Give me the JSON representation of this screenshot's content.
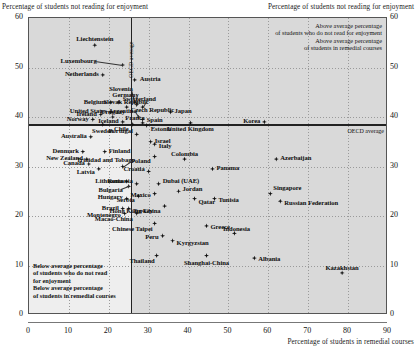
{
  "titles": {
    "y_left": "Percentage of students not reading for enjoyment",
    "y_right": "Percentage of students not reading for enjoyment",
    "x_bottom": "Percentage of students in remedial courses"
  },
  "annotations": {
    "top_right": "Above average percentage\nof students who do not read for enjoyment\nAbove average percentage\nof students in remedial courses",
    "bottom_left": "Below average percentage\nof students who do not read\nfor enjoyment\nBelow average percentage\nof students in remedial courses",
    "oecd_vertical": "OECD average",
    "oecd_horizontal": "OECD average"
  },
  "chart_data": {
    "type": "scatter",
    "title": "",
    "xlabel": "Percentage of students in remedial courses",
    "ylabel": "Percentage of students not reading for enjoyment",
    "xlim": [
      0,
      90
    ],
    "ylim": [
      0,
      60
    ],
    "xticks": [
      0,
      10,
      20,
      30,
      40,
      50,
      60,
      70,
      80,
      90
    ],
    "yticks": [
      0,
      10,
      20,
      30,
      40,
      50,
      60
    ],
    "grid": true,
    "legend": "none",
    "reference_lines": {
      "oecd_average_x": 25.5,
      "oecd_average_y": 37.8
    },
    "points": [
      {
        "name": "Liechtenstein",
        "x": 16.5,
        "y": 54.5
      },
      {
        "name": "Luxembourg",
        "x": 23.5,
        "y": 50.5
      },
      {
        "name": "Netherlands",
        "x": 18.5,
        "y": 48.5
      },
      {
        "name": "Austria",
        "x": 26.5,
        "y": 47.5
      },
      {
        "name": "Slovenia",
        "x": 26.5,
        "y": 43.0
      },
      {
        "name": "Germany",
        "x": 27.0,
        "y": 42.5
      },
      {
        "name": "Slovak Republic",
        "x": 28.5,
        "y": 42.0
      },
      {
        "name": "Belgium",
        "x": 20.5,
        "y": 43.0
      },
      {
        "name": "Switzerland",
        "x": 22.5,
        "y": 43.0
      },
      {
        "name": "Czech Republic",
        "x": 24.5,
        "y": 42.0
      },
      {
        "name": "Japan",
        "x": 35.5,
        "y": 41.0
      },
      {
        "name": "United States",
        "x": 20.5,
        "y": 41.0
      },
      {
        "name": "Ireland",
        "x": 18.0,
        "y": 40.5
      },
      {
        "name": "Argentina",
        "x": 27.5,
        "y": 40.0
      },
      {
        "name": "France",
        "x": 28.5,
        "y": 39.5
      },
      {
        "name": "Uruguay",
        "x": 21.0,
        "y": 40.0
      },
      {
        "name": "Norway",
        "x": 16.0,
        "y": 39.5
      },
      {
        "name": "Iceland",
        "x": 23.5,
        "y": 39.0
      },
      {
        "name": "Sweden",
        "x": 18.5,
        "y": 38.5
      },
      {
        "name": "Chile",
        "x": 26.0,
        "y": 38.5
      },
      {
        "name": "Spain",
        "x": 28.5,
        "y": 38.8
      },
      {
        "name": "Estonia",
        "x": 29.5,
        "y": 38.3
      },
      {
        "name": "United Kingdom",
        "x": 40.5,
        "y": 38.8
      },
      {
        "name": "Korea",
        "x": 59.0,
        "y": 39.0
      },
      {
        "name": "Portugal",
        "x": 27.0,
        "y": 36.5
      },
      {
        "name": "Australia",
        "x": 15.5,
        "y": 36.0
      },
      {
        "name": "Israel",
        "x": 30.5,
        "y": 35.0
      },
      {
        "name": "Italy",
        "x": 31.5,
        "y": 34.5
      },
      {
        "name": "Finland",
        "x": 19.0,
        "y": 33.0
      },
      {
        "name": "Denmark",
        "x": 13.5,
        "y": 33.0
      },
      {
        "name": "New Zealand",
        "x": 14.5,
        "y": 31.5
      },
      {
        "name": "Poland",
        "x": 31.5,
        "y": 32.0
      },
      {
        "name": "Canada",
        "x": 15.0,
        "y": 30.5
      },
      {
        "name": "Colombia",
        "x": 39.0,
        "y": 31.5
      },
      {
        "name": "Azerbaijan",
        "x": 62.0,
        "y": 31.5
      },
      {
        "name": "Latvia",
        "x": 17.5,
        "y": 29.5
      },
      {
        "name": "Trinidad and Tobago",
        "x": 23.5,
        "y": 30.0
      },
      {
        "name": "Croatia",
        "x": 30.0,
        "y": 29.0
      },
      {
        "name": "Panama",
        "x": 46.0,
        "y": 29.5
      },
      {
        "name": "Lithuania",
        "x": 24.5,
        "y": 27.0
      },
      {
        "name": "Bulgaria",
        "x": 25.0,
        "y": 26.0
      },
      {
        "name": "Romania",
        "x": 27.0,
        "y": 26.5
      },
      {
        "name": "Dubai (UAE)",
        "x": 32.5,
        "y": 26.5
      },
      {
        "name": "Singapore",
        "x": 60.5,
        "y": 24.5
      },
      {
        "name": "Hungary",
        "x": 24.5,
        "y": 23.5
      },
      {
        "name": "Mexico",
        "x": 31.5,
        "y": 24.5
      },
      {
        "name": "Jordan",
        "x": 37.5,
        "y": 25.0
      },
      {
        "name": "Serbia",
        "x": 27.5,
        "y": 24.0
      },
      {
        "name": "Qatar",
        "x": 41.5,
        "y": 23.5
      },
      {
        "name": "Tunisia",
        "x": 46.5,
        "y": 23.5
      },
      {
        "name": "Russian Federation",
        "x": 63.0,
        "y": 23.0
      },
      {
        "name": "Brazil",
        "x": 23.5,
        "y": 21.5
      },
      {
        "name": "Turkey",
        "x": 25.0,
        "y": 21.5
      },
      {
        "name": "Montenegro",
        "x": 24.0,
        "y": 20.5
      },
      {
        "name": "Hong Kong-China",
        "x": 34.0,
        "y": 22.0
      },
      {
        "name": "Macao-China",
        "x": 27.0,
        "y": 20.5
      },
      {
        "name": "Greece",
        "x": 44.5,
        "y": 18.0
      },
      {
        "name": "Chinese Taipei",
        "x": 31.5,
        "y": 18.5
      },
      {
        "name": "Indonesia",
        "x": 51.5,
        "y": 16.5
      },
      {
        "name": "Peru",
        "x": 33.5,
        "y": 16.0
      },
      {
        "name": "Kyrgyzstan",
        "x": 36.0,
        "y": 15.0
      },
      {
        "name": "Thailand",
        "x": 32.0,
        "y": 12.0
      },
      {
        "name": "Shanghai-China",
        "x": 44.5,
        "y": 12.0
      },
      {
        "name": "Albania",
        "x": 56.5,
        "y": 11.5
      },
      {
        "name": "Kazakhstan",
        "x": 78.5,
        "y": 8.5
      }
    ]
  }
}
